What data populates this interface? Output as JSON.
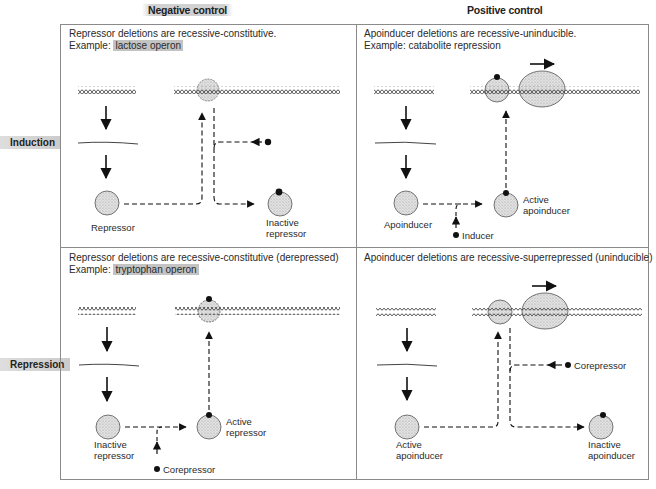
{
  "columns": {
    "negative": "Negative control",
    "positive": "Positive control"
  },
  "rows": {
    "induction": "Induction",
    "repression": "Repression"
  },
  "cells": {
    "neg_induction": {
      "line1": "Repressor deletions are recessive-constitutive.",
      "example_prefix": "Example: ",
      "example": "lactose operon",
      "labels": {
        "regulator": "Repressor",
        "product_line1": "Inactive",
        "product_line2": "repressor"
      }
    },
    "pos_induction": {
      "line1": "Apoinducer deletions are recessive-uninducible.",
      "example_prefix": "Example: ",
      "example": "catabolite repression",
      "labels": {
        "regulator": "Apoinducer",
        "effector": "Inducer",
        "product_line1": "Active",
        "product_line2": "apoinducer"
      }
    },
    "neg_repression": {
      "line1": "Repressor deletions are recessive-constitutive (derepressed)",
      "example_prefix": "Example: ",
      "example": "tryptophan operon",
      "labels": {
        "regulator_line1": "Inactive",
        "regulator_line2": "repressor",
        "effector": "Corepressor",
        "product_line1": "Active",
        "product_line2": "repressor"
      }
    },
    "pos_repression": {
      "line1": "Apoinducer deletions are recessive-superrepressed (uninducible)",
      "labels": {
        "regulator_line1": "Active",
        "regulator_line2": "apoinducer",
        "effector": "Corepressor",
        "product_line1": "Inactive",
        "product_line2": "apoinducer"
      }
    }
  },
  "icons": {
    "dna": "dna-double-helix-icon",
    "mrna": "mrna-strand-icon",
    "protein": "protein-sphere-icon",
    "rna_polymerase": "rna-polymerase-ellipse-icon",
    "small_molecule": "ligand-dot-icon",
    "arrow": "arrow-icon"
  },
  "colors": {
    "border": "#8a8a8a",
    "ink": "#1a1a1a",
    "fill": "#d6d6d6",
    "highlight": "#b8b8b8"
  }
}
